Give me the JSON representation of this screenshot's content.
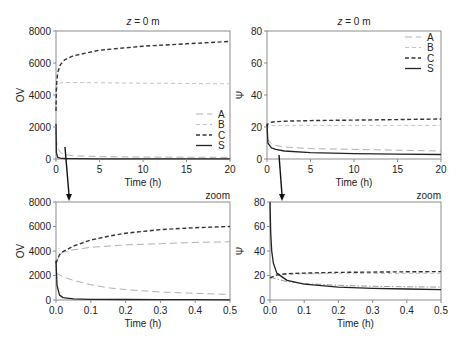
{
  "chart_data": [
    {
      "id": "top-left",
      "type": "line",
      "title": "z = 0 m",
      "title_italic_var": "z",
      "title_rest": " = 0 m",
      "xlabel": "Time (h)",
      "ylabel": "OV",
      "xlim": [
        0,
        20
      ],
      "ylim": [
        0,
        8000
      ],
      "xticks": [
        0,
        5,
        10,
        15,
        20
      ],
      "yticks": [
        0,
        2000,
        4000,
        6000,
        8000
      ],
      "legend": {
        "position": "lower-right",
        "entries": [
          "A",
          "B",
          "C",
          "S"
        ]
      },
      "series": [
        {
          "name": "A",
          "style": "long-dash-light",
          "x": [
            0,
            0.05,
            0.2,
            0.5,
            1,
            2,
            5,
            10,
            15,
            20
          ],
          "y": [
            2000,
            1200,
            700,
            400,
            280,
            200,
            150,
            120,
            110,
            100
          ]
        },
        {
          "name": "B",
          "style": "dash-light",
          "x": [
            0,
            0.05,
            0.2,
            0.5,
            1,
            2,
            5,
            10,
            15,
            20
          ],
          "y": [
            3000,
            4200,
            4600,
            4750,
            4780,
            4780,
            4760,
            4740,
            4720,
            4700
          ]
        },
        {
          "name": "C",
          "style": "dash-dark",
          "x": [
            0,
            0.05,
            0.2,
            0.5,
            1,
            2,
            5,
            10,
            15,
            20
          ],
          "y": [
            3000,
            4500,
            5400,
            5900,
            6200,
            6450,
            6800,
            7050,
            7200,
            7350
          ]
        },
        {
          "name": "S",
          "style": "solid-dark",
          "x": [
            0,
            0.05,
            0.2,
            0.5,
            1,
            2,
            5,
            10,
            15,
            20
          ],
          "y": [
            2200,
            400,
            100,
            50,
            30,
            20,
            15,
            10,
            10,
            10
          ]
        }
      ]
    },
    {
      "id": "top-right",
      "type": "line",
      "title": "z = 0 m",
      "title_italic_var": "z",
      "title_rest": " = 0 m",
      "xlabel": "Time (h)",
      "ylabel": "Ψ",
      "xlim": [
        0,
        20
      ],
      "ylim": [
        0,
        80
      ],
      "xticks": [
        0,
        5,
        10,
        15,
        20
      ],
      "yticks": [
        0,
        20,
        40,
        60,
        80
      ],
      "legend": {
        "position": "upper-right",
        "entries": [
          "A",
          "B",
          "C",
          "S"
        ]
      },
      "series": [
        {
          "name": "A",
          "style": "long-dash-light",
          "x": [
            0,
            0.1,
            0.5,
            1,
            2,
            5,
            10,
            15,
            20
          ],
          "y": [
            20,
            12,
            9.5,
            8.5,
            7.5,
            6.5,
            6,
            5.5,
            5
          ]
        },
        {
          "name": "B",
          "style": "dash-light",
          "x": [
            0,
            0.1,
            0.5,
            1,
            2,
            5,
            10,
            15,
            20
          ],
          "y": [
            18,
            20,
            21,
            21,
            21,
            21,
            21,
            21,
            21
          ]
        },
        {
          "name": "C",
          "style": "dash-dark",
          "x": [
            0,
            0.1,
            0.5,
            1,
            2,
            5,
            10,
            15,
            20
          ],
          "y": [
            20,
            22,
            23,
            23.3,
            23.6,
            24,
            24.3,
            24.6,
            25
          ]
        },
        {
          "name": "S",
          "style": "solid-dark",
          "x": [
            0,
            0.1,
            0.5,
            1,
            2,
            5,
            10,
            15,
            20
          ],
          "y": [
            22,
            10,
            7,
            6,
            5,
            4,
            3.3,
            3,
            2.8
          ]
        }
      ]
    },
    {
      "id": "bottom-left",
      "type": "line",
      "title": "zoom",
      "xlabel": "Time (h)",
      "ylabel": "OV",
      "xlim": [
        0,
        0.5
      ],
      "ylim": [
        0,
        8000
      ],
      "xticks": [
        "0.0",
        "0.1",
        "0.2",
        "0.3",
        "0.4",
        "0.5"
      ],
      "yticks": [
        0,
        2000,
        4000,
        6000,
        8000
      ],
      "series": [
        {
          "name": "A",
          "style": "long-dash-light",
          "x": [
            0,
            0.02,
            0.05,
            0.1,
            0.15,
            0.2,
            0.3,
            0.4,
            0.5
          ],
          "y": [
            2200,
            1900,
            1600,
            1250,
            1000,
            850,
            650,
            550,
            450
          ]
        },
        {
          "name": "B",
          "style": "long-dash-light",
          "x": [
            0,
            0.01,
            0.02,
            0.05,
            0.1,
            0.15,
            0.2,
            0.3,
            0.4,
            0.5
          ],
          "y": [
            3000,
            3700,
            3900,
            4100,
            4300,
            4400,
            4500,
            4600,
            4700,
            4750
          ]
        },
        {
          "name": "C",
          "style": "dash-dark",
          "x": [
            0,
            0.01,
            0.02,
            0.05,
            0.1,
            0.15,
            0.2,
            0.3,
            0.4,
            0.5
          ],
          "y": [
            3000,
            3700,
            3950,
            4400,
            4900,
            5200,
            5450,
            5750,
            5900,
            6000
          ]
        },
        {
          "name": "S",
          "style": "solid-dark",
          "x": [
            0,
            0.003,
            0.01,
            0.02,
            0.05,
            0.1,
            0.2,
            0.3,
            0.4,
            0.5
          ],
          "y": [
            3200,
            1200,
            400,
            200,
            100,
            60,
            40,
            30,
            25,
            20
          ]
        }
      ]
    },
    {
      "id": "bottom-right",
      "type": "line",
      "title": "zoom",
      "xlabel": "Time (h)",
      "ylabel": "Ψ",
      "xlim": [
        0,
        0.5
      ],
      "ylim": [
        0,
        80
      ],
      "xticks": [
        "0.0",
        "0.1",
        "0.2",
        "0.3",
        "0.4",
        "0.5"
      ],
      "yticks": [
        0,
        20,
        40,
        60,
        80
      ],
      "series": [
        {
          "name": "A",
          "style": "dash-dot-light",
          "x": [
            0,
            0.02,
            0.05,
            0.1,
            0.2,
            0.3,
            0.4,
            0.5
          ],
          "y": [
            19,
            17,
            15,
            13.5,
            12,
            11.2,
            10.8,
            10.5
          ]
        },
        {
          "name": "B",
          "style": "dash-light",
          "x": [
            0,
            0.02,
            0.05,
            0.1,
            0.2,
            0.3,
            0.4,
            0.5
          ],
          "y": [
            17,
            20,
            21,
            21.3,
            21.5,
            21.6,
            21.7,
            21.8
          ]
        },
        {
          "name": "C",
          "style": "dash-dark",
          "x": [
            0,
            0.02,
            0.05,
            0.1,
            0.2,
            0.3,
            0.4,
            0.5
          ],
          "y": [
            18,
            20.5,
            21.5,
            22,
            22.5,
            22.8,
            23,
            23.2
          ]
        },
        {
          "name": "S",
          "style": "solid-dark",
          "x": [
            0,
            0.002,
            0.005,
            0.01,
            0.02,
            0.05,
            0.1,
            0.2,
            0.3,
            0.4,
            0.5
          ],
          "y": [
            80,
            55,
            40,
            30,
            22,
            16,
            13,
            10.5,
            9.5,
            9,
            8.5
          ]
        }
      ]
    }
  ],
  "annotations": {
    "zoom_label": "zoom",
    "arrow_desc": "arrows from top plots pointing down to zoomed plots"
  },
  "colors": {
    "axis": "#8c8c8c",
    "text": "#222222",
    "dark_series": "#333333",
    "light_series": "#aaaaaa",
    "mid_series": "#999999"
  }
}
